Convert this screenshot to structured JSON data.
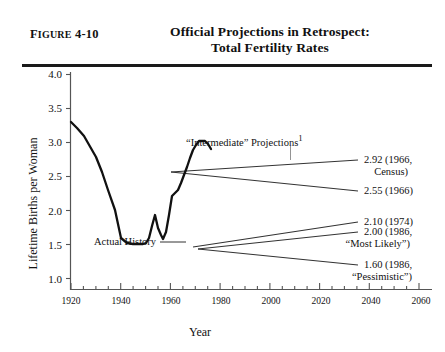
{
  "figure": {
    "number_prefix": "F",
    "number_rest": "IGURE",
    "number_label": "Figure 4-10",
    "number_id": "4-10",
    "title_line1": "Official Projections in Retrospect:",
    "title_line2": "Total Fertility Rates"
  },
  "chart_data": {
    "type": "line",
    "title": "Official Projections in Retrospect: Total Fertility Rates",
    "xlabel": "Year",
    "ylabel": "Lifetime Births per Woman",
    "xlim": [
      1920,
      2065
    ],
    "ylim": [
      1.0,
      4.0
    ],
    "yticks": [
      "1.0",
      "1.5",
      "2.0",
      "2.5",
      "3.0",
      "3.5",
      "4.0"
    ],
    "ytick_values": [
      1.0,
      1.5,
      2.0,
      2.5,
      3.0,
      3.5,
      4.0
    ],
    "xticks": [
      "1920",
      "1940",
      "1960",
      "1980",
      "2000",
      "2020",
      "2040",
      "2060"
    ],
    "xtick_values": [
      1920,
      1940,
      1960,
      1980,
      2000,
      2020,
      2040,
      2060
    ],
    "xminor_step": 5,
    "grid": false,
    "legend": "none",
    "series": [
      {
        "name": "Actual History",
        "style": "solid-thick",
        "x": [
          1920,
          1925,
          1930,
          1933,
          1936,
          1940,
          1943,
          1945,
          1947,
          1948,
          1950,
          1952,
          1955,
          1957,
          1960,
          1962,
          1965,
          1968,
          1970,
          1972,
          1974,
          1976,
          1980,
          1983,
          1986,
          1989,
          1992,
          1995
        ],
        "values": [
          3.27,
          3.05,
          2.55,
          2.12,
          2.11,
          2.23,
          2.51,
          2.42,
          2.95,
          2.88,
          3.03,
          3.25,
          3.5,
          3.63,
          3.61,
          3.38,
          2.93,
          2.46,
          2.47,
          2.02,
          1.83,
          1.74,
          1.82,
          1.8,
          1.84,
          1.9,
          2.02,
          1.98
        ]
      },
      {
        "name": "2.92 (1966, Census)",
        "style": "solid-thin",
        "x": [
          1968,
          2013
        ],
        "values": [
          2.71,
          2.92
        ]
      },
      {
        "name": "2.55 (1966)",
        "style": "solid-thin",
        "x": [
          1968,
          2013
        ],
        "values": [
          2.71,
          2.55
        ]
      },
      {
        "name": "2.10 (1974)",
        "style": "solid-thin",
        "x": [
          1977,
          2013
        ],
        "values": [
          1.81,
          2.1
        ]
      },
      {
        "name": "2.00 (1986, “Most Likely”)",
        "style": "solid-thin",
        "x": [
          1979,
          2013
        ],
        "values": [
          1.79,
          2.0
        ]
      },
      {
        "name": "1.60 (1986, “Pessimistic”)",
        "style": "solid-thin",
        "x": [
          1979,
          2013
        ],
        "values": [
          1.79,
          1.6
        ]
      }
    ],
    "annotations": [
      {
        "id": "intermediate",
        "text": "“Intermediate” Projections",
        "superscript": "1"
      },
      {
        "id": "actual-history",
        "text": "Actual History"
      }
    ],
    "endpoint_labels": [
      {
        "id": "census-1966",
        "line1": "2.92 (1966,",
        "line2": "Census)",
        "value": 2.92,
        "year": 1966,
        "source": "Census"
      },
      {
        "id": "p-1966",
        "line1": "2.55 (1966)",
        "line2": "",
        "value": 2.55,
        "year": 1966
      },
      {
        "id": "p-1974",
        "line1": "2.10 (1974)",
        "line2": "",
        "value": 2.1,
        "year": 1974
      },
      {
        "id": "most-likely-1986",
        "line1": "2.00 (1986,",
        "line2": "“Most Likely”)",
        "value": 2.0,
        "year": 1986
      },
      {
        "id": "pessimistic-1986",
        "line1": "1.60 (1986,",
        "line2": "“Pessimistic”)",
        "value": 1.6,
        "year": 1986
      }
    ]
  }
}
